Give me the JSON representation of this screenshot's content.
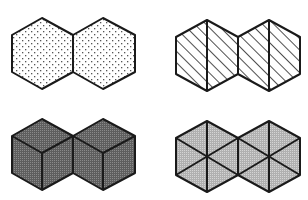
{
  "figure": {
    "panels": [
      {
        "id": "top-left",
        "pattern": "dots",
        "fill": "#ffffff",
        "dot_color": "#555555",
        "subdivision": "none"
      },
      {
        "id": "top-right",
        "pattern": "diagonal-hatch",
        "fill": "#ffffff",
        "hatch_color": "#222222",
        "subdivision": "vertical-center-line"
      },
      {
        "id": "bottom-left",
        "pattern": "dark-stipple",
        "fill": "#6e6e6e",
        "subdivision": "isometric-cube"
      },
      {
        "id": "bottom-right",
        "pattern": "light-stipple",
        "fill": "#b4b4b4",
        "subdivision": "six-triangles"
      }
    ],
    "stroke_color": "#1a1a1a"
  }
}
